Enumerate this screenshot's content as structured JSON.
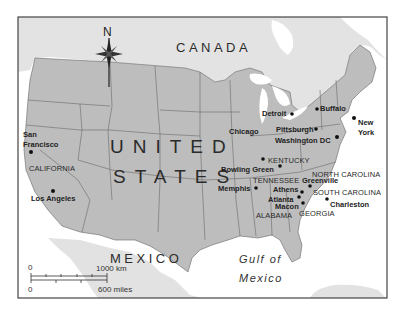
{
  "map": {
    "compass": {
      "label": "N"
    },
    "countries": {
      "canada": "CANADA",
      "usa_line1": "UNITED",
      "usa_line2": "STATES",
      "mexico": "MEXICO"
    },
    "water": {
      "gulf_line1": "Gulf of",
      "gulf_line2": "Mexico"
    },
    "states": {
      "california": "CALIFORNIA",
      "kentucky": "KENTUCKY",
      "tennessee": "TENNESSEE",
      "north_carolina": "NORTH CAROLINA",
      "south_carolina": "SOUTH CAROLINA",
      "georgia": "GEORGIA",
      "alabama": "ALABAMA"
    },
    "cities": {
      "san_francisco_1": "San",
      "san_francisco_2": "Francisco",
      "los_angeles": "Los Angeles",
      "chicago": "Chicago",
      "detroit": "Detroit",
      "buffalo": "Buffalo",
      "pittsburgh": "Pittsburgh",
      "washington": "Washington DC",
      "new_york_1": "New",
      "new_york_2": "York",
      "bowling_green": "Bowling Green",
      "memphis": "Memphis",
      "greenville": "Greenville",
      "athens": "Athens",
      "atlanta": "Atlanta",
      "macon": "Macon",
      "charleston": "Charleston"
    },
    "scale_bar": {
      "zero_top": "0",
      "km": "1000 km",
      "zero_bottom": "0",
      "miles": "600 miles"
    },
    "colors": {
      "usa_fill": "#bdbdbd",
      "foreign_land": "#e2e2e2",
      "water": "#ffffff",
      "border": "#555555"
    }
  }
}
